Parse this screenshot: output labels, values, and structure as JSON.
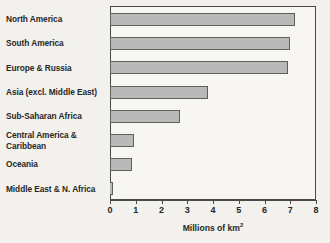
{
  "chart_data": {
    "type": "bar",
    "orientation": "horizontal",
    "title": "",
    "xlabel": "Millions of km2",
    "xlabel_display": "Millions of km",
    "xlabel_superscript": "2",
    "ylabel": "",
    "categories": [
      "North America",
      "South America",
      "Europe & Russia",
      "Asia (excl. Middle East)",
      "Sub-Saharan Africa",
      "Central America &\nCaribbean",
      "Oceania",
      "Middle East & N. Africa"
    ],
    "values": [
      7.2,
      7.0,
      6.9,
      3.8,
      2.7,
      0.95,
      0.85,
      0.1
    ],
    "xlim": [
      0,
      8
    ],
    "xticks": [
      0,
      1,
      2,
      3,
      4,
      5,
      6,
      7,
      8
    ],
    "xtick_labels": [
      "0",
      "1",
      "2",
      "3",
      "4",
      "5",
      "6",
      "7",
      "8"
    ],
    "grid": false,
    "legend": null,
    "colors": {
      "bar_fill": "#b9b9b9",
      "bar_border": "#5e5e5e",
      "frame": "#4a4a4a",
      "plot_background": "#f7f6f3",
      "page_background": "#f2f1ee",
      "text": "#262626"
    }
  }
}
